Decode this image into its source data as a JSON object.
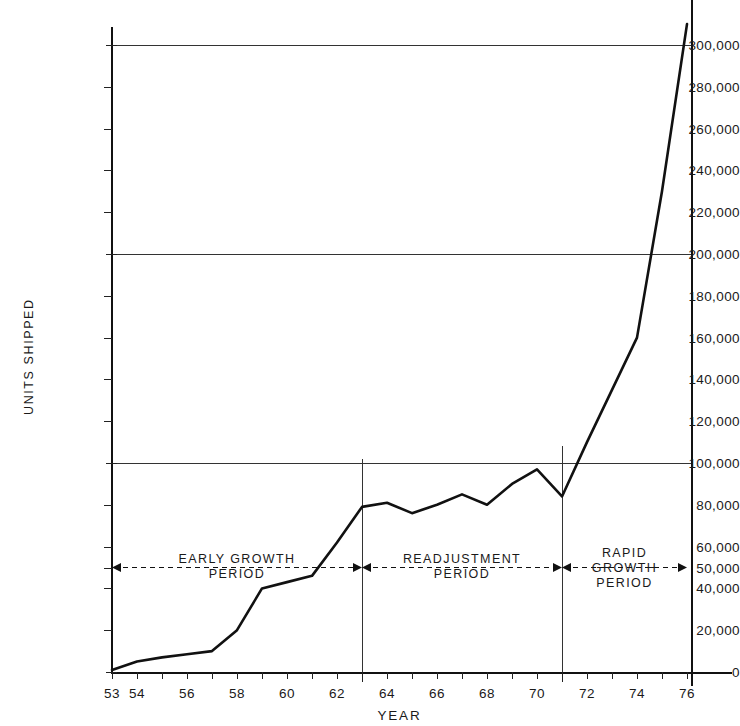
{
  "chart_data": {
    "type": "line",
    "title": "",
    "xlabel": "YEAR",
    "ylabel": "UNITS SHIPPED",
    "xlim": [
      53,
      76
    ],
    "ylim": [
      0,
      310000
    ],
    "grid": "horizontal gridlines at 100,000 / 200,000 / 300,000",
    "legend": "none",
    "x": [
      53,
      54,
      55,
      56,
      57,
      58,
      59,
      60,
      61,
      62,
      63,
      64,
      65,
      66,
      67,
      68,
      69,
      70,
      71,
      72,
      73,
      74,
      75,
      76
    ],
    "values": [
      1000,
      5000,
      7000,
      8500,
      10000,
      20000,
      40000,
      43000,
      46000,
      62000,
      79000,
      81000,
      76000,
      80000,
      85000,
      80000,
      90000,
      97000,
      84000,
      110000,
      135000,
      160000,
      230000,
      310000
    ],
    "series": [
      {
        "name": "Units shipped",
        "values": [
          1000,
          5000,
          7000,
          8500,
          10000,
          20000,
          40000,
          43000,
          46000,
          62000,
          79000,
          81000,
          76000,
          80000,
          85000,
          80000,
          90000,
          97000,
          84000,
          110000,
          135000,
          160000,
          230000,
          310000
        ]
      }
    ],
    "ytick_values": [
      0,
      20000,
      40000,
      50000,
      60000,
      80000,
      100000,
      120000,
      140000,
      160000,
      180000,
      200000,
      220000,
      240000,
      260000,
      280000,
      300000
    ],
    "ytick_labels": [
      "0",
      "20,000",
      "40,000",
      "50,000",
      "60,000",
      "80,000",
      "100,000",
      "120,000",
      "140,000",
      "160,000",
      "180,000",
      "200,000",
      "220,000",
      "240,000",
      "260,000",
      "280,000",
      "300,000"
    ],
    "xtick_values": [
      53,
      54,
      55,
      56,
      57,
      58,
      59,
      60,
      61,
      62,
      63,
      64,
      65,
      66,
      67,
      68,
      69,
      70,
      71,
      72,
      73,
      74,
      75,
      76
    ],
    "xtick_labels_shown": [
      "53",
      "54",
      "56",
      "58",
      "60",
      "62",
      "64",
      "66",
      "68",
      "70",
      "72",
      "74",
      "76"
    ],
    "gridline_values": [
      100000,
      200000,
      300000
    ],
    "divider_years": [
      63,
      71
    ],
    "annotations": [
      {
        "id": "early-growth",
        "text": "EARLY GROWTH\nPERIOD",
        "start_year": 53,
        "end_year": 63,
        "value": 50000
      },
      {
        "id": "readjustment",
        "text": "READJUSTMENT\nPERIOD",
        "start_year": 63,
        "end_year": 71,
        "value": 50000
      },
      {
        "id": "rapid-growth",
        "text": "RAPID\nGROWTH\nPERIOD",
        "start_year": 71,
        "end_year": 76,
        "value": 50000
      }
    ],
    "line_color": "#111111",
    "axis_color": "#111111"
  }
}
